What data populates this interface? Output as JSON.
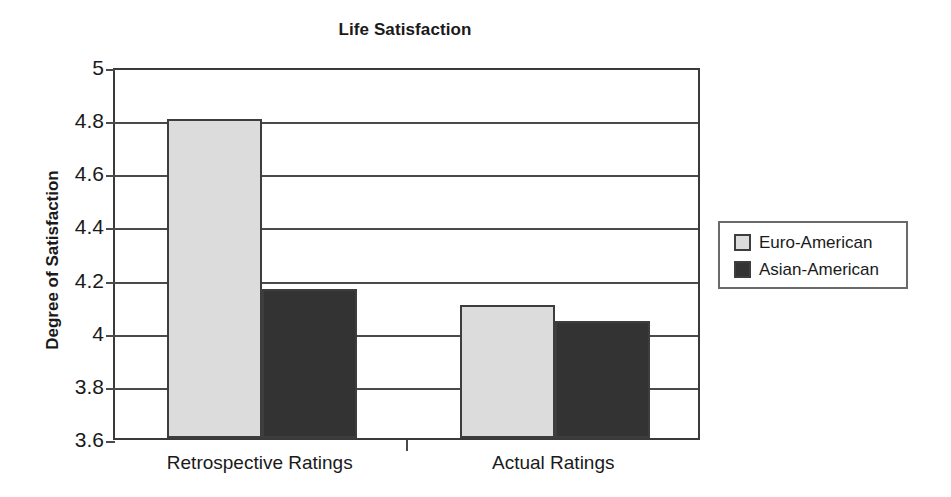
{
  "chart_data": {
    "type": "bar",
    "title": "Life Satisfaction",
    "xlabel": "",
    "ylabel": "Degree of Satisfaction",
    "categories": [
      "Retrospective Ratings",
      "Actual Ratings"
    ],
    "series": [
      {
        "name": "Euro-American",
        "values": [
          4.8,
          4.1
        ],
        "color": "#dcdcdc"
      },
      {
        "name": "Asian-American",
        "values": [
          4.16,
          4.04
        ],
        "color": "#333333"
      }
    ],
    "ylim": [
      3.6,
      5
    ],
    "ytick_values": [
      5,
      4.8,
      4.6,
      4.4,
      4.2,
      4,
      3.8,
      3.6
    ],
    "ytick_labels": [
      "5",
      "4.8",
      "4.6",
      "4.4",
      "4.2",
      "4",
      "3.8",
      "3.6"
    ],
    "grid": true,
    "legend_position": "right"
  },
  "legend": {
    "entries": [
      {
        "label": "Euro-American"
      },
      {
        "label": "Asian-American"
      }
    ]
  }
}
